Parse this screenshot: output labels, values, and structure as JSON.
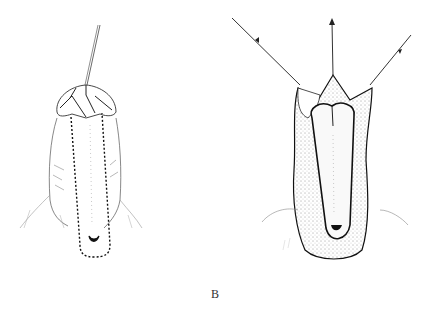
{
  "figure": {
    "panel_label": "B",
    "left_drawing": "Penis with glans held by traction suture; dotted incision outline along ventral shaft",
    "right_drawing": "Opened dissection with three traction sutures pulling tissue flaps; stippled shaft with exposed urethral strip"
  },
  "colors": {
    "ink": "#1a1a1a",
    "light_ink": "#888888",
    "background": "#ffffff"
  }
}
